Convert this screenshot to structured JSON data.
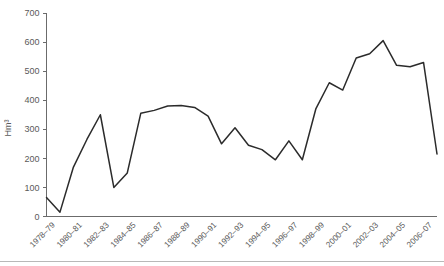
{
  "chart_data": {
    "type": "line",
    "title": "",
    "subtitle": "",
    "xlabel": "",
    "ylabel": "Hm³",
    "ylim": [
      0,
      700
    ],
    "ytick_values": [
      0,
      100,
      200,
      300,
      400,
      500,
      600,
      700
    ],
    "ytick_labels": [
      "0",
      "100",
      "200",
      "300",
      "400",
      "500",
      "600",
      "700"
    ],
    "grid": false,
    "legend": "none",
    "x": [
      "1978–79",
      "1979–80",
      "1980–81",
      "1981–82",
      "1982–83",
      "1983–84",
      "1984–85",
      "1985–86",
      "1986–87",
      "1987–88",
      "1988–89",
      "1989–90",
      "1990–91",
      "1991–92",
      "1992–93",
      "1993–94",
      "1994–95",
      "1995–96",
      "1996–97",
      "1997–98",
      "1998–99",
      "1999–00",
      "2000–01",
      "2001–02",
      "2002–03",
      "2003–04",
      "2004–05",
      "2005–06",
      "2006–07",
      "2007–08"
    ],
    "xtick_labels": [
      "1978–79",
      "1980–81",
      "1982–83",
      "1984–85",
      "1986–87",
      "1988–89",
      "1990–91",
      "1992–93",
      "1994–95",
      "1996–97",
      "1998–99",
      "2000–01",
      "2002–03",
      "2004–05",
      "2006–07"
    ],
    "values": [
      65,
      15,
      170,
      265,
      350,
      100,
      150,
      355,
      365,
      380,
      382,
      375,
      345,
      250,
      305,
      245,
      230,
      195,
      260,
      195,
      370,
      460,
      435,
      545,
      560,
      605,
      520,
      515,
      530,
      215
    ],
    "line_color": "#2b2b2b",
    "axis_color": "#6b6b6b",
    "background_color": "#ffffff"
  }
}
